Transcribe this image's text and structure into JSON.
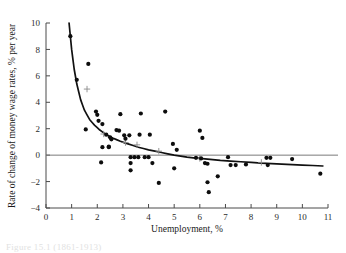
{
  "figure": {
    "caption_partial": "Figure  15.1  (1861-1913)"
  },
  "chart_data": {
    "type": "scatter",
    "title": "",
    "xlabel": "Unemployment, %",
    "ylabel": "Rate of change of money wage rates, % per year",
    "xlim": [
      0,
      11
    ],
    "ylim": [
      -4,
      10
    ],
    "xticks": [
      0,
      1,
      2,
      3,
      4,
      5,
      6,
      7,
      8,
      9,
      10,
      11
    ],
    "xtick_labels": [
      "0",
      "1",
      "2",
      "3",
      "4",
      "5",
      "6",
      "7",
      "8",
      "9",
      "10",
      "11"
    ],
    "yticks": [
      -4,
      -2,
      0,
      2,
      4,
      6,
      8,
      10
    ],
    "ytick_labels": [
      "−4",
      "−2",
      "0",
      "2",
      "4",
      "6",
      "8",
      "10"
    ],
    "grid": false,
    "legend": "none",
    "zero_reference_line": 0,
    "series": [
      {
        "name": "Observations",
        "marker": "filled-circle",
        "color": "#0d0d0d",
        "points": [
          [
            0.95,
            9.0
          ],
          [
            1.2,
            5.7
          ],
          [
            1.65,
            6.9
          ],
          [
            1.55,
            1.95
          ],
          [
            1.95,
            3.3
          ],
          [
            2.0,
            3.05
          ],
          [
            2.05,
            2.6
          ],
          [
            2.2,
            2.35
          ],
          [
            2.15,
            -0.55
          ],
          [
            2.2,
            0.6
          ],
          [
            2.45,
            0.6
          ],
          [
            2.35,
            1.55
          ],
          [
            2.5,
            1.35
          ],
          [
            2.55,
            1.2
          ],
          [
            2.45,
            0.65
          ],
          [
            2.75,
            1.9
          ],
          [
            2.85,
            1.85
          ],
          [
            2.9,
            3.1
          ],
          [
            3.05,
            1.5
          ],
          [
            3.1,
            1.25
          ],
          [
            3.25,
            1.5
          ],
          [
            3.3,
            -0.15
          ],
          [
            3.3,
            -0.6
          ],
          [
            3.3,
            -1.15
          ],
          [
            3.45,
            -0.15
          ],
          [
            3.6,
            -0.15
          ],
          [
            3.65,
            1.55
          ],
          [
            3.7,
            3.15
          ],
          [
            3.85,
            -0.15
          ],
          [
            4.0,
            -0.15
          ],
          [
            4.05,
            1.55
          ],
          [
            4.15,
            -0.6
          ],
          [
            4.4,
            -2.1
          ],
          [
            4.65,
            3.3
          ],
          [
            4.95,
            0.85
          ],
          [
            5.0,
            -1.0
          ],
          [
            5.1,
            0.4
          ],
          [
            5.85,
            -0.2
          ],
          [
            6.0,
            1.85
          ],
          [
            6.05,
            -0.25
          ],
          [
            6.1,
            1.3
          ],
          [
            6.2,
            -0.6
          ],
          [
            6.3,
            -0.65
          ],
          [
            6.3,
            -2.05
          ],
          [
            6.35,
            -2.8
          ],
          [
            6.7,
            -1.6
          ],
          [
            7.1,
            -0.15
          ],
          [
            7.2,
            -0.75
          ],
          [
            7.4,
            -0.75
          ],
          [
            7.8,
            -0.7
          ],
          [
            8.6,
            -0.2
          ],
          [
            8.65,
            -0.75
          ],
          [
            8.75,
            -0.2
          ],
          [
            9.6,
            -0.3
          ],
          [
            10.7,
            -1.4
          ]
        ]
      }
    ],
    "fitted_curve": {
      "name": "Fitted Phillips curve",
      "color": "#111111",
      "points": [
        [
          0.9,
          10.0
        ],
        [
          1.0,
          8.0
        ],
        [
          1.1,
          6.5
        ],
        [
          1.2,
          5.4
        ],
        [
          1.35,
          4.2
        ],
        [
          1.5,
          3.4
        ],
        [
          1.7,
          2.7
        ],
        [
          1.9,
          2.25
        ],
        [
          2.1,
          1.9
        ],
        [
          2.35,
          1.55
        ],
        [
          2.6,
          1.3
        ],
        [
          2.9,
          1.05
        ],
        [
          3.2,
          0.85
        ],
        [
          3.6,
          0.6
        ],
        [
          4.0,
          0.4
        ],
        [
          4.5,
          0.2
        ],
        [
          5.0,
          0.0
        ],
        [
          5.5,
          -0.15
        ],
        [
          6.0,
          -0.25
        ],
        [
          6.8,
          -0.4
        ],
        [
          7.6,
          -0.5
        ],
        [
          8.4,
          -0.6
        ],
        [
          9.2,
          -0.68
        ],
        [
          10.0,
          -0.75
        ],
        [
          10.8,
          -0.82
        ]
      ]
    },
    "cross_markers": {
      "name": "Group means",
      "symbol": "+",
      "color": "#8a8a8a",
      "points": [
        [
          1.6,
          5.0
        ],
        [
          2.25,
          1.6
        ],
        [
          3.1,
          0.95
        ],
        [
          3.55,
          0.78
        ],
        [
          4.4,
          0.3
        ],
        [
          6.0,
          -0.25
        ],
        [
          8.4,
          -0.55
        ]
      ]
    }
  }
}
